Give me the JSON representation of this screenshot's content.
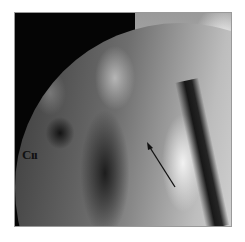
{
  "figure": {
    "type": "fluoroscopic radiograph",
    "label": "Cıı",
    "arrow": {
      "description": "black arrow pointing up-left",
      "color": "#111111"
    }
  }
}
